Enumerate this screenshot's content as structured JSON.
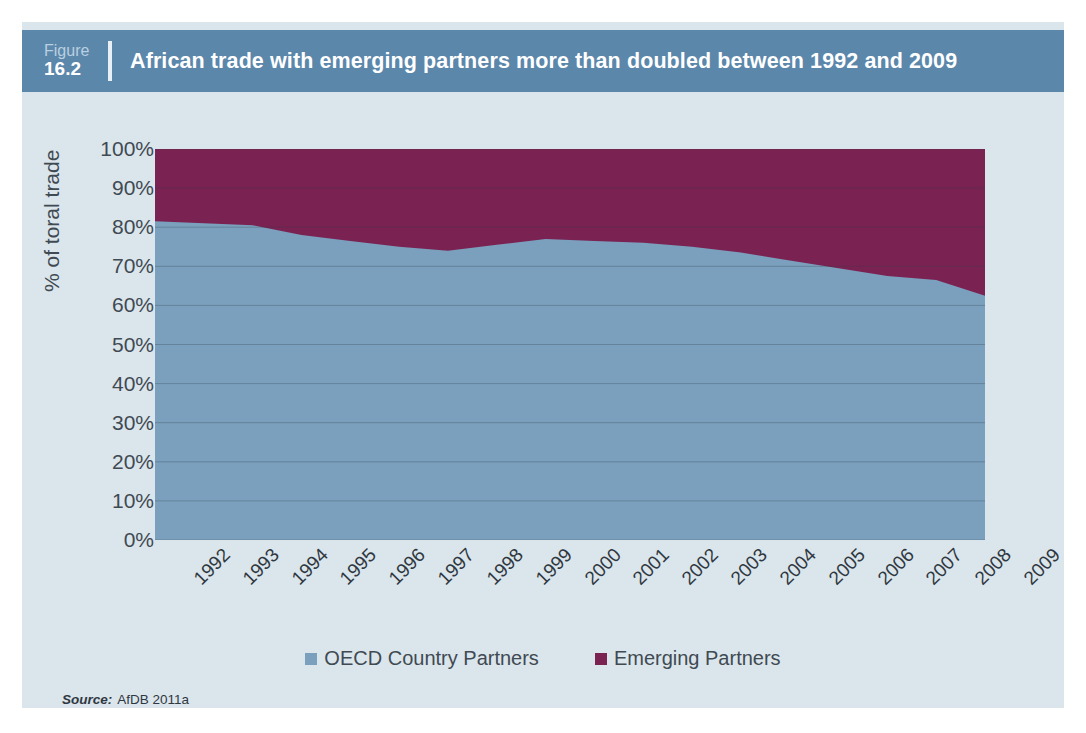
{
  "figure": {
    "tag_word": "Figure",
    "tag_number": "16.2",
    "title": "African trade with emerging partners more than doubled between 1992 and 2009"
  },
  "source": {
    "label": "Source:",
    "value": "AfDB 2011a"
  },
  "colors": {
    "header_band": "#5b87ab",
    "panel_background": "#dbe5ec",
    "oecd_blue": "#7ba0bd",
    "emerging_maroon": "#7a2352",
    "gridline": "#6b8ca6",
    "text": "#3f4a52"
  },
  "legend": {
    "position": "bottom-center",
    "items": [
      {
        "label": "OECD Country Partners",
        "color": "#7ba0bd"
      },
      {
        "label": "Emerging Partners",
        "color": "#7a2352"
      }
    ]
  },
  "chart_data": {
    "type": "area",
    "stacked": true,
    "title": "African trade with emerging partners more than doubled between 1992 and 2009",
    "xlabel": "",
    "ylabel": "% of toral trade",
    "ylim": [
      0,
      100
    ],
    "ytick_labels": [
      "100%",
      "90%",
      "80%",
      "70%",
      "60%",
      "50%",
      "40%",
      "30%",
      "20%",
      "10%",
      "0%"
    ],
    "ytick_values": [
      100,
      90,
      80,
      70,
      60,
      50,
      40,
      30,
      20,
      10,
      0
    ],
    "grid": true,
    "categories": [
      "1992",
      "1993",
      "1994",
      "1995",
      "1996",
      "1997",
      "1998",
      "1999",
      "2000",
      "2001",
      "2002",
      "2003",
      "2004",
      "2005",
      "2006",
      "2007",
      "2008",
      "2009"
    ],
    "series": [
      {
        "name": "OECD Country Partners",
        "color": "#7ba0bd",
        "values": [
          81.5,
          81.0,
          80.5,
          78.0,
          76.5,
          75.0,
          74.0,
          75.5,
          77.0,
          76.5,
          76.0,
          75.0,
          73.5,
          71.5,
          69.5,
          67.5,
          66.5,
          62.5
        ]
      },
      {
        "name": "Emerging Partners",
        "color": "#7a2352",
        "values": [
          18.5,
          19.0,
          19.5,
          22.0,
          23.5,
          25.0,
          26.0,
          24.5,
          23.0,
          23.5,
          24.0,
          25.0,
          26.5,
          28.5,
          30.5,
          32.5,
          33.5,
          37.5
        ]
      }
    ]
  }
}
